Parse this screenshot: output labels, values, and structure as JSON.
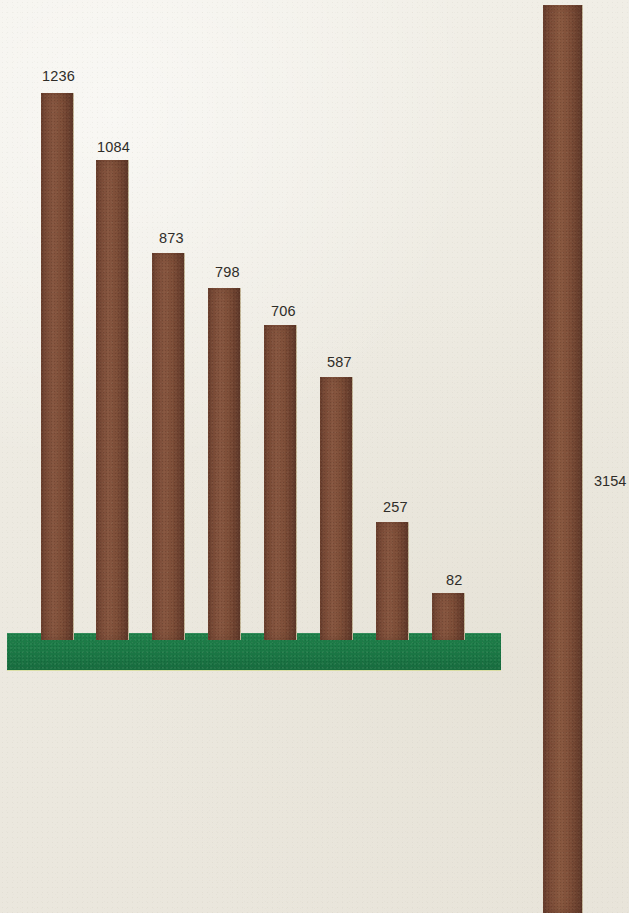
{
  "chart_data": {
    "type": "bar",
    "title": "",
    "subtitle": "",
    "xlabel": "",
    "ylabel": "",
    "grid": false,
    "legend": "none",
    "orientation": "vertical",
    "baseline_color": "#1d7d47",
    "bar_color": "#7a4a33",
    "background_color": "#efece4",
    "label_color": "#2e2c28",
    "ylim": [
      0,
      3154
    ],
    "categories": [
      "1",
      "2",
      "3",
      "4",
      "5",
      "6",
      "7",
      "8",
      "9"
    ],
    "values": [
      1236,
      1084,
      873,
      798,
      706,
      587,
      257,
      82,
      3154
    ],
    "series": [
      {
        "name": "values",
        "values": [
          1236,
          1084,
          873,
          798,
          706,
          587,
          257,
          82,
          3154
        ]
      }
    ],
    "bars": [
      {
        "value": 1236,
        "label": "1236",
        "left": 41,
        "width": 33,
        "top": 93,
        "bottom": 640,
        "group": "main"
      },
      {
        "value": 1084,
        "label": "1084",
        "left": 96,
        "width": 33,
        "top": 160,
        "bottom": 640,
        "group": "main"
      },
      {
        "value": 873,
        "label": "873",
        "left": 152,
        "width": 33,
        "top": 253,
        "bottom": 640,
        "group": "main"
      },
      {
        "value": 798,
        "label": "798",
        "left": 208,
        "width": 33,
        "top": 288,
        "bottom": 640,
        "group": "main"
      },
      {
        "value": 706,
        "label": "706",
        "left": 264,
        "width": 33,
        "top": 325,
        "bottom": 640,
        "group": "main"
      },
      {
        "value": 587,
        "label": "587",
        "left": 320,
        "width": 33,
        "top": 377,
        "bottom": 640,
        "group": "main"
      },
      {
        "value": 257,
        "label": "257",
        "left": 376,
        "width": 33,
        "top": 522,
        "bottom": 640,
        "group": "main"
      },
      {
        "value": 82,
        "label": "82",
        "left": 432,
        "width": 33,
        "top": 593,
        "bottom": 640,
        "group": "main"
      },
      {
        "value": 3154,
        "label": "3154",
        "left": 543,
        "width": 40,
        "top": 5,
        "bottom": 913,
        "group": "total"
      }
    ],
    "annotations": [
      {
        "text": "1236",
        "x": 42,
        "y": 68
      },
      {
        "text": "1084",
        "x": 97,
        "y": 139
      },
      {
        "text": "873",
        "x": 159,
        "y": 230
      },
      {
        "text": "798",
        "x": 215,
        "y": 264
      },
      {
        "text": "706",
        "x": 271,
        "y": 303
      },
      {
        "text": "587",
        "x": 327,
        "y": 354
      },
      {
        "text": "257",
        "x": 383,
        "y": 499
      },
      {
        "text": "82",
        "x": 446,
        "y": 572
      },
      {
        "text": "3154",
        "x": 594,
        "y": 473
      }
    ]
  },
  "baseline": {
    "left": 7,
    "top": 633,
    "width": 494,
    "height": 37,
    "color": "#1d7d47"
  }
}
